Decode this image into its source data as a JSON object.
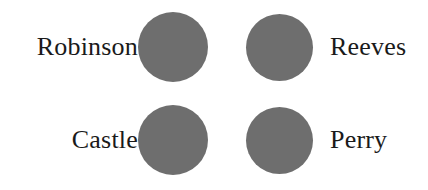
{
  "figure": {
    "background_color": "#ffffff",
    "circle_color": "#6e6e6e",
    "label_color": "#1a1a1a",
    "rows": [
      {
        "left_label": "Robinson",
        "right_label": "Reeves",
        "circles": [
          {
            "name": "circle-top-left",
            "shape": "circle"
          },
          {
            "name": "circle-top-right",
            "shape": "circle"
          }
        ]
      },
      {
        "left_label": "Castle",
        "right_label": "Perry",
        "circles": [
          {
            "name": "circle-bottom-left",
            "shape": "circle"
          },
          {
            "name": "circle-bottom-right",
            "shape": "circle"
          }
        ]
      }
    ]
  }
}
